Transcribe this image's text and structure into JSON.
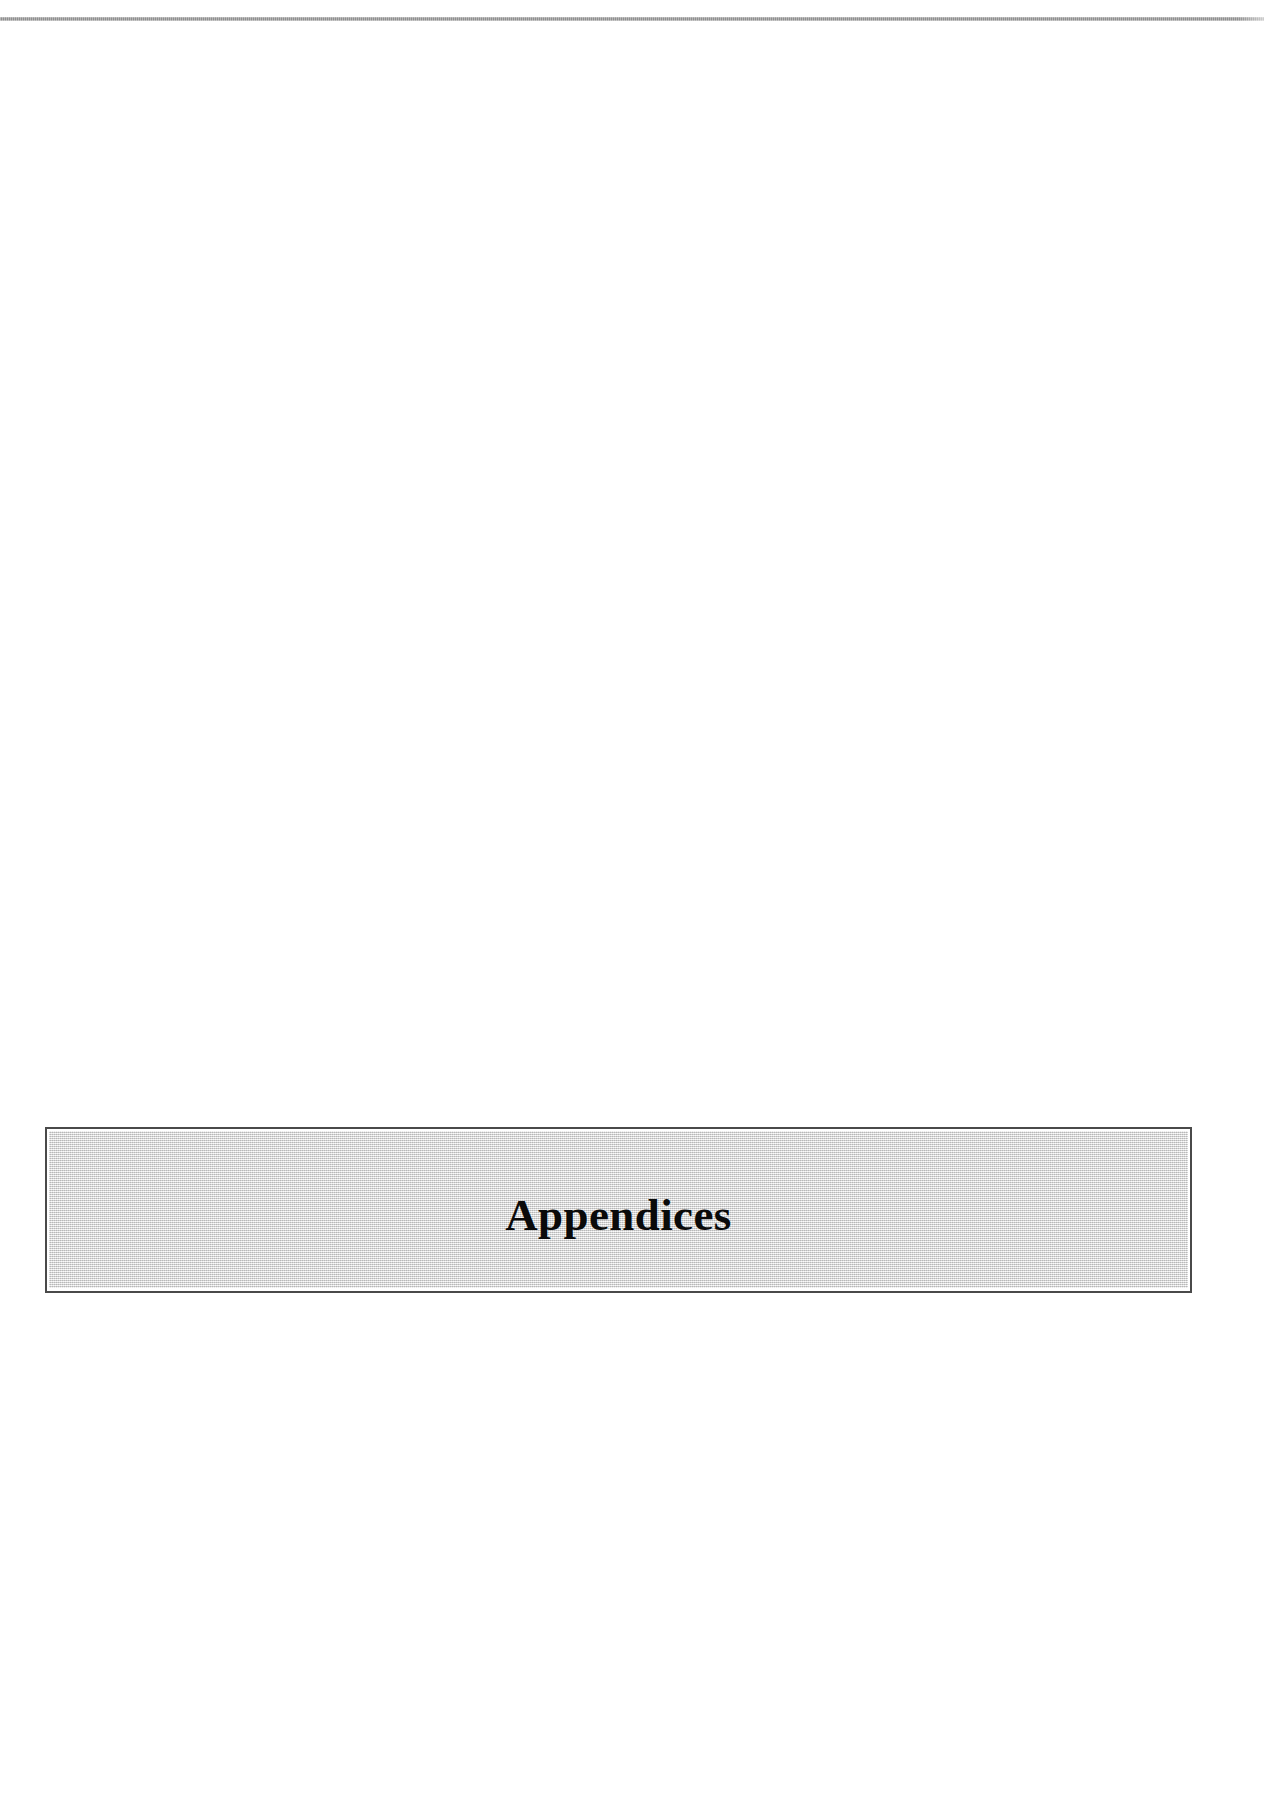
{
  "document": {
    "page_background": "#ffffff",
    "header_rule": {
      "name": "header-rule",
      "color": "#8d8d8d",
      "visible": true
    },
    "body": {
      "blank_upper": "",
      "blank_lower": ""
    },
    "banner": {
      "title": "Appendices",
      "fill_color": "#e3e3e3",
      "border_color": "#4a4a4a",
      "text_color": "#0a0a0a"
    }
  }
}
